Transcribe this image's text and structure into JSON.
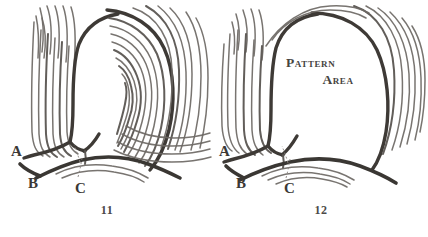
{
  "plate": {
    "name": "fingerprint-type-lines-plate",
    "background_color": "#ffffff",
    "ink_color": "#3e3a36",
    "ridge_color": "#5a5551"
  },
  "figures": [
    {
      "id": "11",
      "caption": "11",
      "description": "Loop pattern with type lines and delta",
      "labels": [
        {
          "key": "A",
          "text": "A",
          "x": 11,
          "y": 144
        },
        {
          "key": "B",
          "text": "B",
          "x": 28,
          "y": 176
        },
        {
          "key": "C",
          "text": "C",
          "x": 75,
          "y": 181
        }
      ],
      "annotation": null
    },
    {
      "id": "12",
      "caption": "12",
      "description": "Type lines enclosing the pattern area",
      "labels": [
        {
          "key": "A",
          "text": "A",
          "x": 5,
          "y": 144
        },
        {
          "key": "B",
          "text": "B",
          "x": 22,
          "y": 176
        },
        {
          "key": "C",
          "text": "C",
          "x": 70,
          "y": 181
        }
      ],
      "annotation": {
        "line1": "Pattern",
        "line2": "Area"
      }
    }
  ]
}
